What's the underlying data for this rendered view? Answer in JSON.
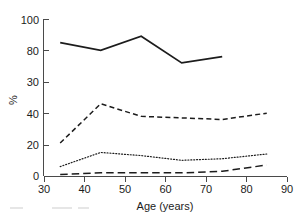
{
  "chart_data": {
    "type": "line",
    "title": "",
    "subtitle": "",
    "xlabel": "Age (years)",
    "ylabel": "%",
    "xlim": [
      30,
      90
    ],
    "ylim": [
      0,
      100
    ],
    "grid": false,
    "legend": "none",
    "x_ticks": [
      30,
      40,
      50,
      60,
      70,
      80,
      90
    ],
    "x_tick_labels": [
      "30",
      "40",
      "50",
      "60",
      "70",
      "80",
      "90"
    ],
    "y_ticks": [
      0,
      20,
      40,
      60,
      80,
      100
    ],
    "y_tick_labels": [
      "0",
      "20",
      "40",
      "30",
      "80",
      "100"
    ],
    "series": [
      {
        "name": "series-solid",
        "style": "solid",
        "color": "#1c1c1c",
        "x": [
          34,
          44,
          54,
          64,
          74
        ],
        "values": [
          85,
          80,
          89,
          72,
          76
        ]
      },
      {
        "name": "series-dashed",
        "style": "dashed",
        "color": "#1c1c1c",
        "x": [
          34,
          44,
          54,
          64,
          74,
          85
        ],
        "values": [
          21,
          46,
          38,
          37,
          36,
          40
        ]
      },
      {
        "name": "series-dotted",
        "style": "dotted",
        "color": "#1c1c1c",
        "x": [
          34,
          44,
          54,
          64,
          74,
          85
        ],
        "values": [
          6,
          15,
          13,
          10,
          11,
          14
        ]
      },
      {
        "name": "series-long-dashed",
        "style": "long-dashed",
        "color": "#1c1c1c",
        "x": [
          34,
          44,
          54,
          64,
          74,
          85
        ],
        "values": [
          1,
          2,
          2,
          2,
          3,
          7
        ]
      }
    ]
  }
}
